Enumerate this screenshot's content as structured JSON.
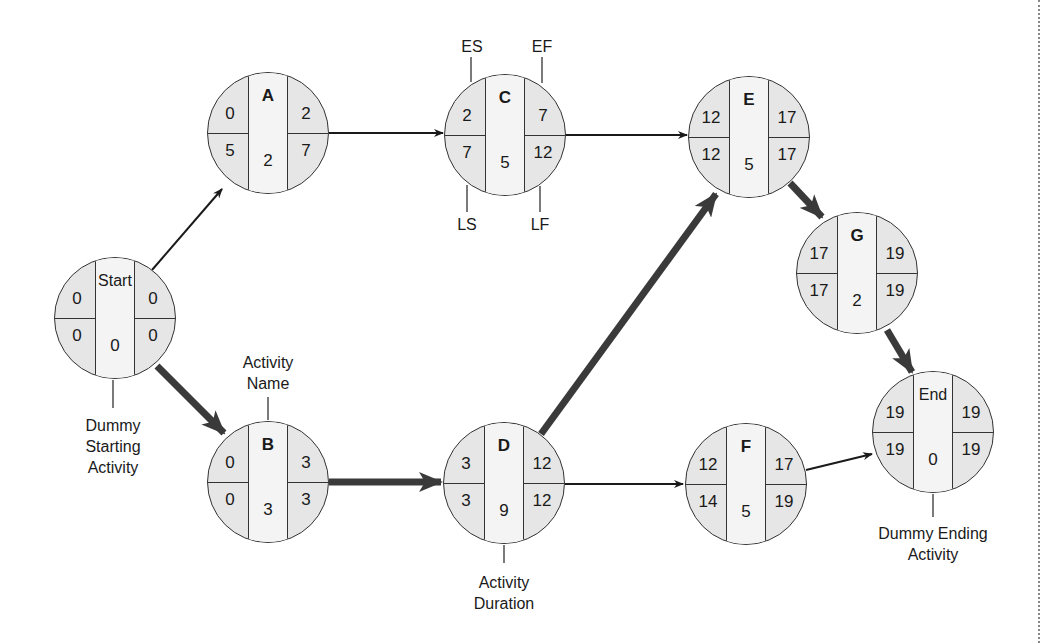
{
  "diagram": {
    "type": "activity-on-node network (critical path)",
    "nodes": [
      {
        "id": "start",
        "name": "Start",
        "es": "0",
        "ef": "0",
        "ls": "0",
        "lf": "0",
        "duration": "0",
        "cx": 115,
        "cy": 318,
        "bold": false
      },
      {
        "id": "a",
        "name": "A",
        "es": "0",
        "ef": "2",
        "ls": "5",
        "lf": "7",
        "duration": "2",
        "cx": 268,
        "cy": 133,
        "bold": true
      },
      {
        "id": "b",
        "name": "B",
        "es": "0",
        "ef": "3",
        "ls": "0",
        "lf": "3",
        "duration": "3",
        "cx": 268,
        "cy": 482,
        "bold": true
      },
      {
        "id": "c",
        "name": "C",
        "es": "2",
        "ef": "7",
        "ls": "7",
        "lf": "12",
        "duration": "5",
        "cx": 505,
        "cy": 135,
        "bold": true
      },
      {
        "id": "d",
        "name": "D",
        "es": "3",
        "ef": "12",
        "ls": "3",
        "lf": "12",
        "duration": "9",
        "cx": 504,
        "cy": 483,
        "bold": true
      },
      {
        "id": "e",
        "name": "E",
        "es": "12",
        "ef": "17",
        "ls": "12",
        "lf": "17",
        "duration": "5",
        "cx": 749,
        "cy": 137,
        "bold": true
      },
      {
        "id": "f",
        "name": "F",
        "es": "12",
        "ef": "17",
        "ls": "14",
        "lf": "19",
        "duration": "5",
        "cx": 746,
        "cy": 484,
        "bold": true
      },
      {
        "id": "g",
        "name": "G",
        "es": "17",
        "ef": "19",
        "ls": "17",
        "lf": "19",
        "duration": "2",
        "cx": 857,
        "cy": 273,
        "bold": true
      },
      {
        "id": "end",
        "name": "End",
        "es": "19",
        "ef": "19",
        "ls": "19",
        "lf": "19",
        "duration": "0",
        "cx": 933,
        "cy": 432,
        "bold": false
      }
    ],
    "edges": [
      {
        "from": "start",
        "to": "a",
        "critical": false,
        "x1": 152,
        "y1": 270,
        "x2": 222,
        "y2": 189
      },
      {
        "from": "start",
        "to": "b",
        "critical": true,
        "x1": 157,
        "y1": 366,
        "x2": 224,
        "y2": 433
      },
      {
        "from": "a",
        "to": "c",
        "critical": false,
        "x1": 329,
        "y1": 133,
        "x2": 443,
        "y2": 133
      },
      {
        "from": "c",
        "to": "e",
        "critical": false,
        "x1": 526,
        "y1": 135,
        "x2": 687,
        "y2": 135
      },
      {
        "from": "b",
        "to": "d",
        "critical": true,
        "x1": 329,
        "y1": 482,
        "x2": 441,
        "y2": 482
      },
      {
        "from": "d",
        "to": "e",
        "critical": true,
        "x1": 541,
        "y1": 434,
        "x2": 716,
        "y2": 194
      },
      {
        "from": "d",
        "to": "f",
        "critical": false,
        "x1": 565,
        "y1": 484,
        "x2": 683,
        "y2": 484
      },
      {
        "from": "e",
        "to": "g",
        "critical": true,
        "x1": 790,
        "y1": 183,
        "x2": 822,
        "y2": 217
      },
      {
        "from": "g",
        "to": "end",
        "critical": true,
        "x1": 887,
        "y1": 330,
        "x2": 912,
        "y2": 372
      },
      {
        "from": "f",
        "to": "end",
        "critical": false,
        "x1": 806,
        "y1": 470,
        "x2": 872,
        "y2": 454
      }
    ],
    "annotations": {
      "es": "ES",
      "ef": "EF",
      "ls": "LS",
      "lf": "LF",
      "activity_name": "Activity\nName",
      "activity_duration": "Activity\nDuration",
      "dummy_start": "Dummy\nStarting\nActivity",
      "dummy_end": "Dummy Ending\nActivity"
    },
    "colors": {
      "quadrant_fill": "#e6e6e6",
      "center_fill": "#f4f4f4",
      "outline": "#333333",
      "critical_arrow": "#3a3a3a",
      "normal_arrow": "#1a1a1a"
    }
  }
}
